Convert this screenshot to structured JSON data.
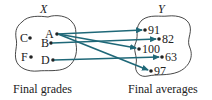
{
  "diagram": {
    "domain_set": {
      "name": "X",
      "caption": "Final grades",
      "elements": [
        "A",
        "B",
        "C",
        "D",
        "F"
      ]
    },
    "codomain_set": {
      "name": "Y",
      "caption": "Final averages",
      "elements": [
        "91",
        "82",
        "100",
        "63",
        "97"
      ]
    },
    "mappings": [
      {
        "from": "A",
        "to": "91"
      },
      {
        "from": "A",
        "to": "100"
      },
      {
        "from": "A",
        "to": "97"
      },
      {
        "from": "B",
        "to": "82"
      },
      {
        "from": "D",
        "to": "63"
      }
    ],
    "colors": {
      "arrow": "#1f6878",
      "outline": "#333333",
      "text": "#222222"
    }
  }
}
